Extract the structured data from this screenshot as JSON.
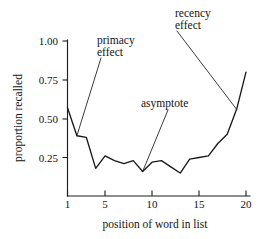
{
  "chart_data": {
    "type": "line",
    "title": "",
    "xlabel": "position of word in list",
    "ylabel": "proportion recalled",
    "xlim": [
      0.4,
      20.6
    ],
    "ylim": [
      0.08,
      1.04
    ],
    "grid": false,
    "legend": "none",
    "x_ticks": [
      1,
      5,
      10,
      15,
      20
    ],
    "x_tick_labels": [
      "1",
      "5",
      "10",
      "15",
      "20"
    ],
    "y_ticks": [
      0.25,
      0.5,
      0.75,
      1.0
    ],
    "y_tick_labels": [
      "0.25",
      "0.50",
      "0.75",
      "1.00"
    ],
    "x": [
      1,
      2,
      3,
      4,
      5,
      6,
      7,
      8,
      9,
      10,
      11,
      12,
      13,
      14,
      15,
      16,
      17,
      18,
      19,
      20
    ],
    "values": [
      0.57,
      0.39,
      0.38,
      0.18,
      0.26,
      0.23,
      0.21,
      0.23,
      0.16,
      0.22,
      0.23,
      0.19,
      0.15,
      0.24,
      0.25,
      0.26,
      0.34,
      0.4,
      0.56,
      0.8
    ],
    "series": [
      {
        "name": "proportion recalled",
        "values": [
          0.57,
          0.39,
          0.38,
          0.18,
          0.26,
          0.23,
          0.21,
          0.23,
          0.16,
          0.22,
          0.23,
          0.19,
          0.15,
          0.24,
          0.25,
          0.26,
          0.34,
          0.4,
          0.56,
          0.8
        ]
      }
    ],
    "annotations": [
      {
        "id": "primacy",
        "line1": "primacy",
        "line2": "effect",
        "points_to_x": 2,
        "points_to_y": 0.39
      },
      {
        "id": "asymptote",
        "line1": "asymptote",
        "line2": "",
        "points_to_x": 9,
        "points_to_y": 0.16
      },
      {
        "id": "recency",
        "line1": "recency",
        "line2": "effect",
        "points_to_x": 19,
        "points_to_y": 0.56
      }
    ],
    "colors": {
      "curve": "#1a1a1a",
      "axis": "#1d1d1d",
      "text": "#141414",
      "background": "#ffffff"
    }
  }
}
